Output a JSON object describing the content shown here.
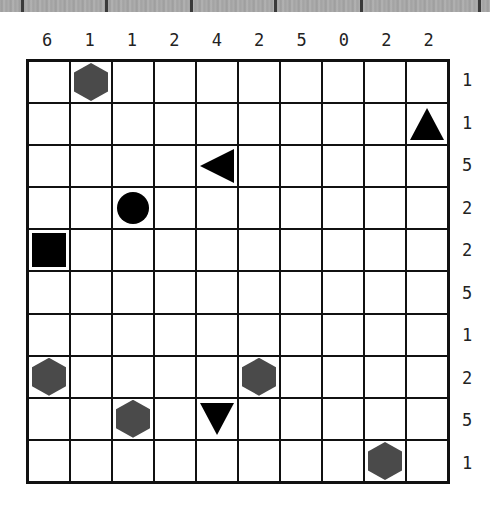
{
  "puzzle": {
    "rows": 10,
    "cols": 10,
    "column_clues": [
      "6",
      "1",
      "1",
      "2",
      "4",
      "2",
      "5",
      "0",
      "2",
      "2"
    ],
    "row_clues": [
      "1",
      "1",
      "5",
      "2",
      "2",
      "5",
      "1",
      "2",
      "5",
      "1"
    ],
    "pieces": [
      {
        "row": 0,
        "col": 1,
        "type": "hexagon",
        "color": "#4a4a4a"
      },
      {
        "row": 1,
        "col": 9,
        "type": "triangle-up",
        "color": "#000000"
      },
      {
        "row": 2,
        "col": 4,
        "type": "triangle-left",
        "color": "#000000"
      },
      {
        "row": 3,
        "col": 2,
        "type": "circle",
        "color": "#000000"
      },
      {
        "row": 4,
        "col": 0,
        "type": "square",
        "color": "#000000"
      },
      {
        "row": 7,
        "col": 0,
        "type": "hexagon",
        "color": "#4a4a4a"
      },
      {
        "row": 7,
        "col": 5,
        "type": "hexagon",
        "color": "#4a4a4a"
      },
      {
        "row": 8,
        "col": 2,
        "type": "hexagon",
        "color": "#4a4a4a"
      },
      {
        "row": 8,
        "col": 4,
        "type": "triangle-down",
        "color": "#000000"
      },
      {
        "row": 9,
        "col": 8,
        "type": "hexagon",
        "color": "#4a4a4a"
      }
    ]
  }
}
